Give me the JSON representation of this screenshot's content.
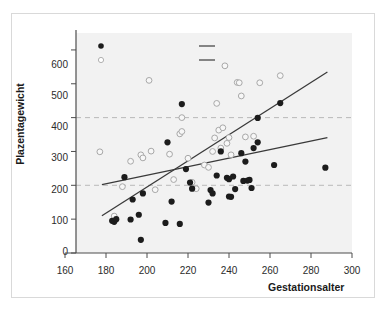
{
  "chart_data": {
    "type": "scatter",
    "title": "",
    "xlabel": "Gestationsalter",
    "ylabel": "Plazentagewicht",
    "xlim": [
      160,
      300
    ],
    "ylim": [
      0,
      650
    ],
    "xticks": [
      160,
      180,
      200,
      220,
      240,
      260,
      280,
      300
    ],
    "yticks": [
      0,
      100,
      200,
      300,
      400,
      500,
      600
    ],
    "grid": "horizontal dashed at 200 and 400",
    "gridlines_y": [
      200,
      400
    ],
    "legend_position": "top-inside",
    "series": [
      {
        "name": "dNNF",
        "marker": "filled-circle",
        "color": "#1c1c1c",
        "points": [
          [
            183,
            95
          ],
          [
            184,
            92
          ],
          [
            185,
            100
          ],
          [
            189,
            224
          ],
          [
            192,
            99
          ],
          [
            193,
            158
          ],
          [
            196,
            113
          ],
          [
            197,
            39
          ],
          [
            198,
            176
          ],
          [
            209,
            89
          ],
          [
            210,
            327
          ],
          [
            212,
            152
          ],
          [
            216,
            86
          ],
          [
            217,
            440
          ],
          [
            219,
            248
          ],
          [
            221,
            208
          ],
          [
            222,
            190
          ],
          [
            230,
            149
          ],
          [
            231,
            186
          ],
          [
            232,
            176
          ],
          [
            234,
            229
          ],
          [
            236,
            300
          ],
          [
            239,
            222
          ],
          [
            240,
            218
          ],
          [
            240,
            167
          ],
          [
            241,
            166
          ],
          [
            242,
            226
          ],
          [
            243,
            189
          ],
          [
            246,
            295
          ],
          [
            247,
            213
          ],
          [
            248,
            270
          ],
          [
            249,
            214
          ],
          [
            250,
            216
          ],
          [
            251,
            192
          ],
          [
            252,
            310
          ],
          [
            254,
            327
          ],
          [
            254,
            399
          ],
          [
            262,
            260
          ],
          [
            265,
            443
          ],
          [
            287,
            252
          ]
        ]
      },
      {
        "name": "matched controls",
        "marker": "open-circle",
        "color": "#9a9a9a",
        "points": [
          [
            177,
            299
          ],
          [
            184,
            109
          ],
          [
            188,
            196
          ],
          [
            192,
            271
          ],
          [
            197,
            290
          ],
          [
            198,
            281
          ],
          [
            201,
            510
          ],
          [
            202,
            301
          ],
          [
            204,
            187
          ],
          [
            211,
            292
          ],
          [
            213,
            217
          ],
          [
            216,
            352
          ],
          [
            217,
            400
          ],
          [
            217,
            359
          ],
          [
            220,
            280
          ],
          [
            222,
            209
          ],
          [
            224,
            190
          ],
          [
            228,
            260
          ],
          [
            230,
            253
          ],
          [
            232,
            300
          ],
          [
            233,
            340
          ],
          [
            234,
            442
          ],
          [
            235,
            363
          ],
          [
            236,
            310
          ],
          [
            237,
            370
          ],
          [
            238,
            553
          ],
          [
            239,
            324
          ],
          [
            240,
            341
          ],
          [
            241,
            290
          ],
          [
            244,
            504
          ],
          [
            245,
            503
          ],
          [
            246,
            464
          ],
          [
            248,
            343
          ],
          [
            252,
            345
          ],
          [
            255,
            503
          ],
          [
            265,
            524
          ]
        ]
      }
    ],
    "trendlines": [
      {
        "name": "linear von dNNF",
        "color": "#3a3a3a",
        "x": [
          178,
          288
        ],
        "y": [
          202,
          341
        ]
      },
      {
        "name": "linear von matched controls",
        "color": "#3a3a3a",
        "x": [
          178,
          288
        ],
        "y": [
          110,
          535
        ]
      }
    ]
  },
  "axes": {
    "y_title": "Plazentagewicht",
    "x_title": "Gestationsalter",
    "y_tick_labels": [
      "600",
      "500",
      "400",
      "300",
      "200",
      "100",
      "0"
    ],
    "x_tick_labels": [
      "160",
      "180",
      "200",
      "220",
      "240",
      "260",
      "280",
      "300"
    ]
  },
  "legend": {
    "entries": [
      {
        "label": "dNNF",
        "marker": "filled-circle"
      },
      {
        "label": "matched controls",
        "marker": "open-circle"
      },
      {
        "label": "linear von dNNF",
        "marker": "line"
      },
      {
        "label": "linear von matched controls",
        "marker": "line"
      }
    ]
  }
}
